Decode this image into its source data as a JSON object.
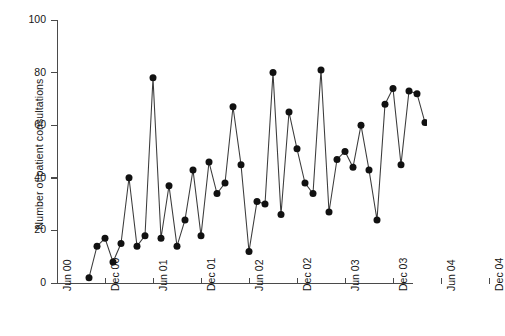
{
  "chart_data": {
    "type": "line",
    "title": "",
    "xlabel": "",
    "ylabel": "Number of patient consultations",
    "ylim": [
      0,
      100
    ],
    "yticks": [
      0,
      20,
      40,
      60,
      80,
      100
    ],
    "xticks": [
      "Jun 00",
      "Dec 00",
      "Jun 01",
      "Dec 01",
      "Jun 02",
      "Dec 02",
      "Jun 03",
      "Dec 03",
      "Jun 04",
      "Dec 04"
    ],
    "grid": false,
    "legend": null,
    "markers": "filled-circle",
    "marker_color": "#111111",
    "line_color": "#3b3b3b",
    "x_unit": "month",
    "x_start": "Oct 00",
    "series": [
      {
        "name": "Number of patient consultations",
        "x": [
          "Oct 00",
          "Nov 00",
          "Dec 00",
          "Jan 01",
          "Feb 01",
          "Mar 01",
          "Apr 01",
          "May 01",
          "Jun 01",
          "Jul 01",
          "Aug 01",
          "Sep 01",
          "Oct 01",
          "Nov 01",
          "Dec 01",
          "Jan 02",
          "Feb 02",
          "Mar 02",
          "Apr 02",
          "May 02",
          "Jun 02",
          "Jul 02",
          "Aug 02",
          "Sep 02",
          "Oct 02",
          "Nov 02",
          "Dec 02",
          "Jan 03",
          "Feb 03",
          "Mar 03",
          "Apr 03",
          "May 03",
          "Jun 03",
          "Jul 03",
          "Aug 03",
          "Sep 03",
          "Oct 03",
          "Nov 03",
          "Dec 03",
          "Jan 04",
          "Feb 04",
          "Mar 04",
          "Apr 04"
        ],
        "values": [
          2,
          14,
          17,
          8,
          15,
          40,
          14,
          18,
          78,
          17,
          37,
          14,
          24,
          43,
          18,
          46,
          34,
          38,
          67,
          45,
          12,
          31,
          30,
          80,
          26,
          65,
          51,
          38,
          34,
          81,
          27,
          47,
          50,
          44,
          60,
          43,
          24,
          68,
          74,
          45,
          73,
          72,
          61
        ]
      }
    ]
  },
  "axes": {
    "y_tick_labels": [
      "0",
      "20",
      "40",
      "60",
      "80",
      "100"
    ]
  }
}
